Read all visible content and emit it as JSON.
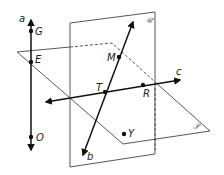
{
  "diagram": {
    "planes": [
      {
        "id": "U",
        "label": "𝒰",
        "type": "vertical"
      },
      {
        "id": "P",
        "label": "𝒫",
        "type": "horizontal"
      }
    ],
    "lines": [
      {
        "id": "a",
        "label": "a",
        "direction": "vertical, passes through G, E, O"
      },
      {
        "id": "b",
        "label": "b",
        "direction": "oblique, passes through M, T"
      },
      {
        "id": "c",
        "label": "c",
        "direction": "horizontal-ish, passes through T, R"
      }
    ],
    "points": [
      {
        "id": "G",
        "label": "G"
      },
      {
        "id": "E",
        "label": "E"
      },
      {
        "id": "O",
        "label": "O"
      },
      {
        "id": "M",
        "label": "M"
      },
      {
        "id": "T",
        "label": "T"
      },
      {
        "id": "R",
        "label": "R"
      },
      {
        "id": "Y",
        "label": "Y"
      }
    ],
    "colors": {
      "line": "#111111",
      "plane_edge": "#444444",
      "plane_fill": "#ffffff"
    }
  }
}
